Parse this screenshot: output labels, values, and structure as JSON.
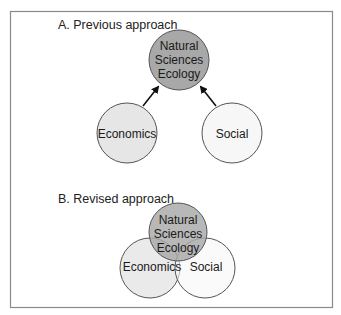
{
  "panel_a": {
    "title": "A. Previous approach",
    "nodes": {
      "natural": {
        "lines": [
          "Natural",
          "Sciences",
          "Ecology"
        ],
        "fill": "#a8a8a8"
      },
      "economics": {
        "label": "Economics",
        "fill": "#e6e6e6"
      },
      "social": {
        "label": "Social",
        "fill": "#f7f7f7"
      }
    },
    "arrows": [
      {
        "from": "economics",
        "to": "natural"
      },
      {
        "from": "social",
        "to": "natural"
      }
    ]
  },
  "panel_b": {
    "title": "B. Revised approach",
    "nodes": {
      "natural": {
        "lines": [
          "Natural",
          "Sciences",
          "Ecology"
        ],
        "fill": "#a8a8a8"
      },
      "economics": {
        "label": "Economics",
        "fill": "#e6e6e6"
      },
      "social": {
        "label": "Social",
        "fill": "#f7f7f7"
      }
    }
  },
  "colors": {
    "border": "#8a8a8a",
    "stroke": "#555555",
    "text": "#222222"
  }
}
